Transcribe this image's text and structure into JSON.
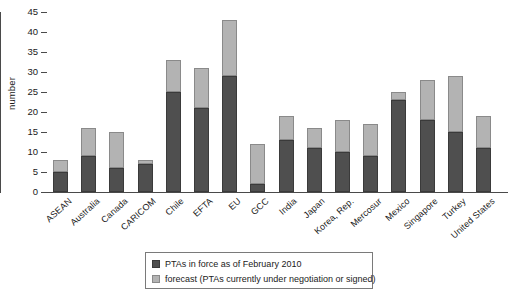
{
  "chart_data": {
    "type": "bar",
    "stacked": true,
    "title": "",
    "xlabel": "",
    "ylabel": "number",
    "ylim": [
      0,
      45
    ],
    "ytick_step": 5,
    "yticks": [
      0,
      5,
      10,
      15,
      20,
      25,
      30,
      35,
      40,
      45
    ],
    "grid": false,
    "legend_position": "bottom-center",
    "categories": [
      "ASEAN",
      "Australia",
      "Canada",
      "CARICOM",
      "Chile",
      "EFTA",
      "EU",
      "GCC",
      "India",
      "Japan",
      "Korea, Rep.",
      "Mercosur",
      "Mexico",
      "Singapore",
      "Turkey",
      "United States"
    ],
    "series": [
      {
        "name": "PTAs in force as of February 2010",
        "color": "#4f4f4f",
        "values": [
          5,
          9,
          6,
          7,
          25,
          21,
          29,
          2,
          13,
          11,
          10,
          9,
          23,
          18,
          15,
          11
        ]
      },
      {
        "name": "forecast (PTAs currently under negotiation or signed)",
        "color": "#b3b3b3",
        "values": [
          3,
          7,
          9,
          1,
          8,
          10,
          14,
          10,
          6,
          5,
          8,
          8,
          2,
          10,
          14,
          8
        ]
      }
    ],
    "totals": [
      8,
      16,
      15,
      8,
      33,
      31,
      43,
      12,
      19,
      16,
      18,
      17,
      25,
      28,
      29,
      19
    ]
  },
  "axis": {
    "y_title": "number"
  },
  "legend": {
    "items": [
      {
        "label": "PTAs in force as of February 2010",
        "swatch": "dark-swatch"
      },
      {
        "label": "forecast (PTAs currently under negotiation or signed)",
        "swatch": "light-swatch"
      }
    ]
  }
}
